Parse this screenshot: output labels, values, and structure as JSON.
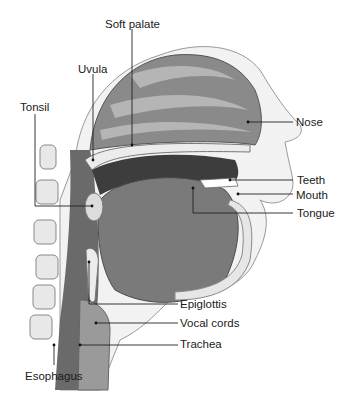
{
  "figure": {
    "labels": {
      "soft_palate": "Soft palate",
      "uvula": "Uvula",
      "tonsil": "Tonsil",
      "nose": "Nose",
      "teeth": "Teeth",
      "mouth": "Mouth",
      "tongue": "Tongue",
      "epiglottis": "Epiglottis",
      "vocal_cords": "Vocal cords",
      "trachea": "Trachea",
      "esophagus": "Esophagus"
    },
    "colors": {
      "skin": "#f2f2f2",
      "nasal_cavity": "#8a8a8a",
      "turbinate": "#b5b5b5",
      "tissue_dark": "#5a5a5a",
      "tongue": "#7a7a7a",
      "bone": "#e6e6e6",
      "leader_line": "#222222"
    }
  }
}
